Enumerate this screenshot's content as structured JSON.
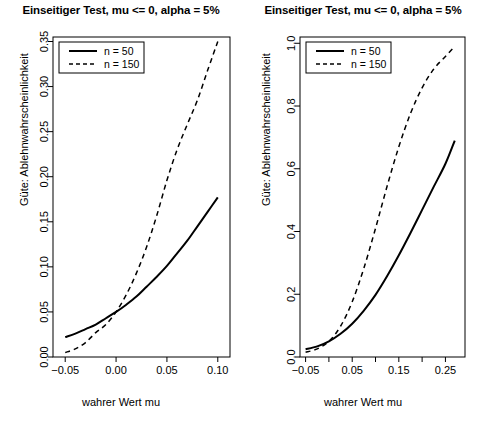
{
  "figure": {
    "background": "#ffffff",
    "foreground": "#000000",
    "panel_count": 2
  },
  "chart_data": [
    {
      "panel": "left",
      "type": "line",
      "title": "Einseitiger Test, mu <= 0, alpha = 5%",
      "xlabel": "wahrer Wert mu",
      "ylabel": "Güte: Ablehnwahrscheinlichkeit",
      "xlim": [
        -0.062,
        0.112
      ],
      "ylim": [
        0.0,
        0.355
      ],
      "grid": false,
      "legend_position": "top-left",
      "xticks": [
        -0.05,
        0.0,
        0.05,
        0.1
      ],
      "xticklabels": [
        "-0.05",
        "0.00",
        "0.05",
        "0.10"
      ],
      "yticks": [
        0.0,
        0.05,
        0.1,
        0.15,
        0.2,
        0.25,
        0.3,
        0.35
      ],
      "yticklabels": [
        "0.00",
        "0.05",
        "0.10",
        "0.15",
        "0.20",
        "0.25",
        "0.30",
        "0.35"
      ],
      "x": [
        -0.05,
        -0.04,
        -0.03,
        -0.02,
        -0.01,
        0.0,
        0.01,
        0.02,
        0.03,
        0.04,
        0.05,
        0.06,
        0.07,
        0.08,
        0.09,
        0.1
      ],
      "series": [
        {
          "name": "n = 50",
          "linestyle": "solid",
          "color": "#000000",
          "values": [
            0.022,
            0.026,
            0.031,
            0.036,
            0.043,
            0.05,
            0.058,
            0.067,
            0.078,
            0.089,
            0.101,
            0.115,
            0.129,
            0.145,
            0.161,
            0.177
          ]
        },
        {
          "name": "n = 150",
          "linestyle": "dashed",
          "color": "#000000",
          "values": [
            0.005,
            0.009,
            0.016,
            0.027,
            0.036,
            0.05,
            0.069,
            0.093,
            0.122,
            0.157,
            0.196,
            0.23,
            0.258,
            0.285,
            0.318,
            0.35
          ]
        }
      ]
    },
    {
      "panel": "right",
      "type": "line",
      "title": "Einseitiger Test, mu <= 0, alpha = 5%",
      "xlabel": "wahrer Wert mu",
      "ylabel": "Güte: Ablehnwahrscheinlichkeit",
      "xlim": [
        -0.062,
        0.292
      ],
      "ylim": [
        0.0,
        1.02
      ],
      "grid": false,
      "legend_position": "top-left",
      "xticks": [
        -0.05,
        0.0,
        0.05,
        0.1,
        0.15,
        0.2,
        0.25
      ],
      "xticklabels": [
        "-0.05",
        "",
        "0.05",
        "",
        "0.15",
        "",
        "0.25"
      ],
      "yticks": [
        0.0,
        0.2,
        0.4,
        0.6,
        0.8,
        1.0
      ],
      "yticklabels": [
        "0.0",
        "0.2",
        "0.4",
        "0.6",
        "0.8",
        "1.0"
      ],
      "x": [
        -0.05,
        -0.025,
        0.0,
        0.025,
        0.05,
        0.075,
        0.1,
        0.125,
        0.15,
        0.175,
        0.2,
        0.225,
        0.25,
        0.27
      ],
      "series": [
        {
          "name": "n = 50",
          "linestyle": "solid",
          "color": "#000000",
          "values": [
            0.025,
            0.034,
            0.05,
            0.074,
            0.106,
            0.148,
            0.198,
            0.258,
            0.324,
            0.395,
            0.469,
            0.543,
            0.616,
            0.69
          ]
        },
        {
          "name": "n = 150",
          "linestyle": "dashed",
          "color": "#000000",
          "values": [
            0.015,
            0.026,
            0.05,
            0.098,
            0.176,
            0.283,
            0.41,
            0.545,
            0.67,
            0.776,
            0.858,
            0.918,
            0.958,
            0.99
          ]
        }
      ]
    }
  ],
  "left": {
    "title": "Einseitiger Test, mu <= 0, alpha = 5%",
    "xlabel": "wahrer Wert mu",
    "ylabel": "Güte: Ablehnwahrscheinlichkeit",
    "legend": {
      "items": [
        {
          "label": "n = 50",
          "style": "solid"
        },
        {
          "label": "n = 150",
          "style": "dashed"
        }
      ]
    },
    "xticklabels": [
      "-0.05",
      "0.00",
      "0.05",
      "0.10"
    ],
    "yticklabels": [
      "0.00",
      "0.05",
      "0.10",
      "0.15",
      "0.20",
      "0.25",
      "0.30",
      "0.35"
    ]
  },
  "right": {
    "title": "Einseitiger Test, mu <= 0, alpha = 5%",
    "xlabel": "wahrer Wert mu",
    "ylabel": "Güte: Ablehnwahrscheinlichkeit",
    "legend": {
      "items": [
        {
          "label": "n = 50",
          "style": "solid"
        },
        {
          "label": "n = 150",
          "style": "dashed"
        }
      ]
    },
    "xticklabels": [
      "-0.05",
      "0.05",
      "0.15",
      "0.25"
    ],
    "yticklabels": [
      "0.0",
      "0.2",
      "0.4",
      "0.6",
      "0.8",
      "1.0"
    ]
  }
}
